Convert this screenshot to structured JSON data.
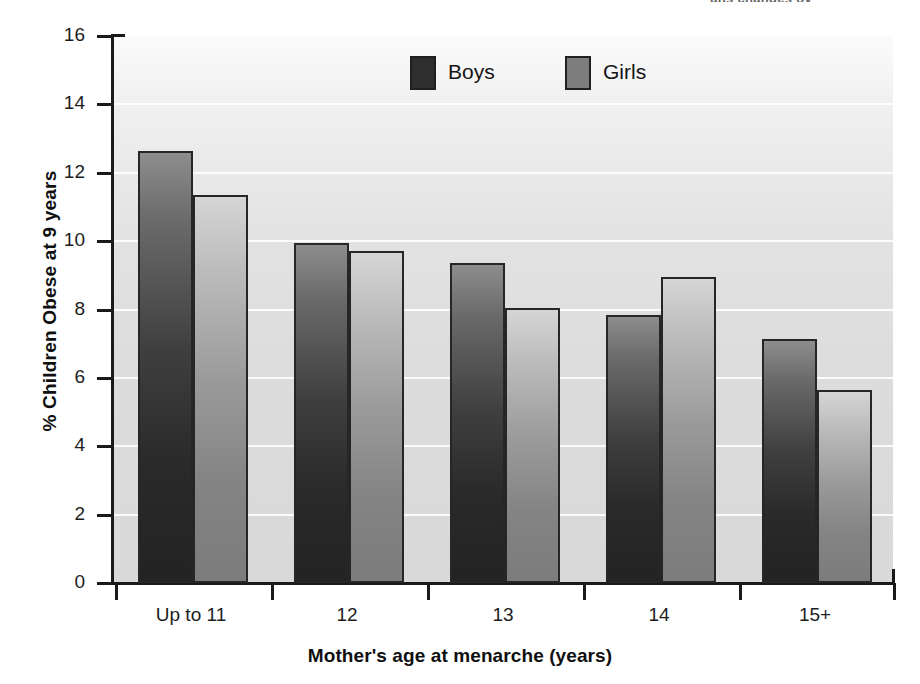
{
  "figure": {
    "title_fragment": "ans changes ov",
    "background_color": "#ffffff"
  },
  "legend": {
    "position": "top-center-inside",
    "entries": [
      {
        "label": "Boys",
        "color": "#2e2e2e"
      },
      {
        "label": "Girls",
        "color": "#7d7d7d"
      }
    ]
  },
  "chart_data": {
    "type": "bar",
    "title": "",
    "xlabel": "Mother's age at menarche (years)",
    "ylabel": "% Children Obese at 9 years",
    "categories": [
      "Up to 11",
      "12",
      "13",
      "14",
      "15+"
    ],
    "series": [
      {
        "name": "Boys",
        "color": "#2e2e2e",
        "values": [
          12.65,
          9.95,
          9.35,
          7.85,
          7.15
        ]
      },
      {
        "name": "Girls",
        "color": "#7d7d7d",
        "values": [
          11.35,
          9.7,
          8.05,
          8.95,
          5.65
        ]
      }
    ],
    "ylim": [
      0,
      16
    ],
    "yticks": [
      0,
      2,
      4,
      6,
      8,
      10,
      12,
      14,
      16
    ],
    "ytick_labels": [
      "0",
      "2",
      "4",
      "6",
      "8",
      "10",
      "12",
      "14",
      "16"
    ],
    "grid": true,
    "grid_axis": "y",
    "legend_position": "top-center"
  }
}
